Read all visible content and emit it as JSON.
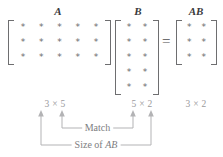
{
  "figure": {
    "entry_symbol": "*",
    "equals_sign": "=",
    "times_symbol": "×"
  },
  "matrices": [
    {
      "name": "A",
      "label": "A",
      "rows": 3,
      "cols": 5,
      "dimension_label": "3 × 5",
      "entries": [
        [
          "*",
          "*",
          "*",
          "*",
          "*"
        ],
        [
          "*",
          "*",
          "*",
          "*",
          "*"
        ],
        [
          "*",
          "*",
          "*",
          "*",
          "*"
        ]
      ]
    },
    {
      "name": "B",
      "label": "B",
      "rows": 5,
      "cols": 2,
      "dimension_label": "5 × 2",
      "entries": [
        [
          "*",
          "*"
        ],
        [
          "*",
          "*"
        ],
        [
          "*",
          "*"
        ],
        [
          "*",
          "*"
        ],
        [
          "*",
          "*"
        ]
      ]
    },
    {
      "name": "AB",
      "label": "AB",
      "rows": 3,
      "cols": 2,
      "dimension_label": "3 × 2",
      "entries": [
        [
          "*",
          "*"
        ],
        [
          "*",
          "*"
        ],
        [
          "*",
          "*"
        ]
      ]
    }
  ],
  "annotations": {
    "inner": {
      "label": "Match",
      "label_prefix": "Match",
      "label_italic": ""
    },
    "outer": {
      "label": "Size of AB",
      "label_prefix": "Size of ",
      "label_italic": "AB"
    }
  },
  "colors": {
    "ink": "#58585a",
    "bracket": "#6e6e70",
    "dimension_text": "#9a9a9c",
    "annotation_line": "#b3b3b5",
    "annotation_text": "#7d7d7f",
    "background": "#ffffff"
  }
}
